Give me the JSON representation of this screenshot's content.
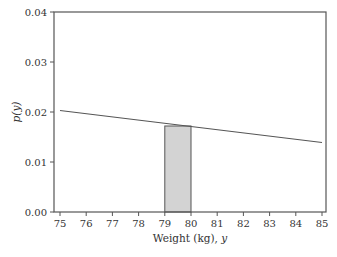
{
  "chart_data": {
    "type": "line",
    "title": "",
    "xlabel": "Weight (kg), y",
    "ylabel": "p(y)",
    "xlim": [
      74.8,
      85.2
    ],
    "ylim": [
      0.0,
      0.04
    ],
    "x_ticks": [
      "75",
      "76",
      "77",
      "78",
      "79",
      "80",
      "81",
      "82",
      "83",
      "84",
      "85"
    ],
    "y_ticks": [
      "0.00",
      "0.01",
      "0.02",
      "0.03",
      "0.04"
    ],
    "grid": false,
    "legend": null,
    "series": [
      {
        "name": "density",
        "type": "line",
        "x": [
          75,
          85
        ],
        "y": [
          0.0203,
          0.0139
        ]
      }
    ],
    "shaded_region": {
      "x_start": 79,
      "x_end": 80,
      "height": 0.0172,
      "color": "#d0d0d0"
    }
  },
  "colors": {
    "axis": "#555555",
    "line": "#555555",
    "bar_fill": "#d3d3d3",
    "bar_stroke": "#555555"
  }
}
